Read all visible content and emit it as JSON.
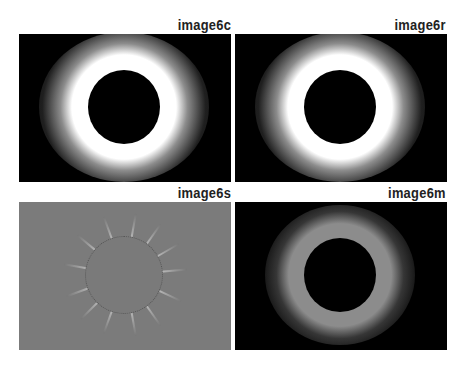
{
  "figure": {
    "panels": [
      {
        "id": "c",
        "label": "image6c",
        "type": "bright-corona",
        "background": "#000000",
        "corona_color": "#ffffff"
      },
      {
        "id": "r",
        "label": "image6r",
        "type": "bright-corona",
        "background": "#000000",
        "corona_color": "#ffffff"
      },
      {
        "id": "s",
        "label": "image6s",
        "type": "gradient-filtered",
        "background": "#7b7b7b"
      },
      {
        "id": "m",
        "label": "image6m",
        "type": "dim-corona",
        "background": "#000000",
        "corona_color": "#8a8a8a"
      }
    ]
  }
}
